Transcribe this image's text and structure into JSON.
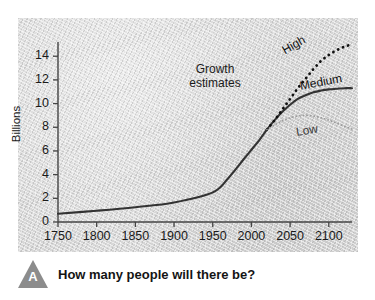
{
  "figure": {
    "badge_letter": "A",
    "caption": "How many people will there be?"
  },
  "chart_data": {
    "type": "line",
    "title": "",
    "xlabel": "",
    "ylabel": "Billions",
    "xlim": [
      1750,
      2130
    ],
    "ylim": [
      0,
      15.2
    ],
    "grid": false,
    "legend": "inline-curve-labels",
    "xticks": [
      1750,
      1800,
      1850,
      1900,
      1950,
      2000,
      2050,
      2100
    ],
    "yticks": [
      0,
      2,
      4,
      6,
      8,
      10,
      12,
      14
    ],
    "annotations": [
      {
        "text": "Growth estimates",
        "x": 1965,
        "y": 12.4
      }
    ],
    "colors": {
      "high": "#111111",
      "medium": "#333333",
      "low": "#9a9a9a",
      "axis": "#444444",
      "panel": "#d7d7d7",
      "badge": "#8c8c8c"
    },
    "series": [
      {
        "name": "High",
        "style": "dotted-bold",
        "x": [
          2020,
          2030,
          2040,
          2050,
          2060,
          2070,
          2080,
          2090,
          2100,
          2110,
          2120,
          2130
        ],
        "values": [
          7.8,
          8.6,
          9.5,
          10.4,
          11.3,
          12.1,
          12.9,
          13.6,
          14.1,
          14.5,
          14.8,
          15.0
        ]
      },
      {
        "name": "Medium",
        "style": "solid",
        "x": [
          1750,
          1800,
          1850,
          1900,
          1950,
          1970,
          1990,
          2000,
          2010,
          2020,
          2030,
          2040,
          2050,
          2060,
          2070,
          2080,
          2090,
          2100,
          2110,
          2120,
          2130
        ],
        "values": [
          0.7,
          0.95,
          1.25,
          1.65,
          2.5,
          3.7,
          5.3,
          6.1,
          6.9,
          7.8,
          8.6,
          9.3,
          9.9,
          10.4,
          10.7,
          10.95,
          11.1,
          11.2,
          11.25,
          11.3,
          11.3
        ]
      },
      {
        "name": "Low",
        "style": "dotted-fine",
        "x": [
          2020,
          2030,
          2040,
          2050,
          2060,
          2070,
          2080,
          2090,
          2100,
          2110,
          2120,
          2130
        ],
        "values": [
          7.8,
          8.2,
          8.55,
          8.8,
          8.95,
          9.0,
          8.95,
          8.8,
          8.6,
          8.35,
          8.1,
          7.85
        ]
      }
    ]
  }
}
